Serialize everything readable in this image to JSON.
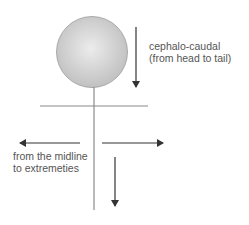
{
  "diagram": {
    "labels": {
      "cephalo_line1": "cephalo-caudal",
      "cephalo_line2": "(from head to tail)",
      "midline_line1": "from the midline",
      "midline_line2": "to extremeties"
    },
    "colors": {
      "head_fill": "#c4c4c4",
      "head_highlight": "#ececec",
      "line": "#8a8a8a",
      "arrow": "#333333",
      "text": "#555555"
    }
  }
}
